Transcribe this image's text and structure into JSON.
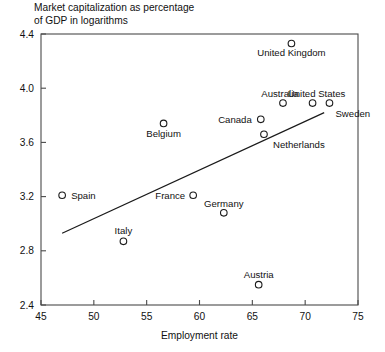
{
  "chart_data": {
    "type": "scatter",
    "title_line1": "Market capitalization as percentage",
    "title_line2": "of GDP in logarithms",
    "xlabel": "Employment rate",
    "ylabel": "",
    "xlim": [
      45,
      75
    ],
    "ylim": [
      2.4,
      4.4
    ],
    "xticks": [
      45,
      50,
      55,
      60,
      65,
      70,
      75
    ],
    "xtick_labels": [
      "45",
      "50",
      "55",
      "60",
      "65",
      "70",
      "75"
    ],
    "yticks": [
      2.4,
      2.8,
      3.2,
      3.6,
      4.0,
      4.4
    ],
    "ytick_labels": [
      "2.4",
      "2.8",
      "3.2",
      "3.6",
      "4.0",
      "4.4"
    ],
    "grid": false,
    "legend": false,
    "marker": "open-circle",
    "marker_color": "#1a1a1a",
    "points": [
      {
        "label": "United Kingdom",
        "x": 68.7,
        "y": 4.33,
        "label_dx": 0,
        "label_dy": 13,
        "label_anchor": "middle"
      },
      {
        "label": "Australia",
        "x": 67.9,
        "y": 3.89,
        "label_dx": -3,
        "label_dy": -6,
        "label_anchor": "middle"
      },
      {
        "label": "United States",
        "x": 70.7,
        "y": 3.89,
        "label_dx": 4,
        "label_dy": -6,
        "label_anchor": "middle"
      },
      {
        "label": "Sweden",
        "x": 72.3,
        "y": 3.89,
        "label_dx": 6,
        "label_dy": 14,
        "label_anchor": "start"
      },
      {
        "label": "Canada",
        "x": 65.8,
        "y": 3.77,
        "label_dx": -9,
        "label_dy": 4,
        "label_anchor": "end"
      },
      {
        "label": "Netherlands",
        "x": 66.1,
        "y": 3.66,
        "label_dx": 9,
        "label_dy": 14,
        "label_anchor": "start"
      },
      {
        "label": "Belgium",
        "x": 56.6,
        "y": 3.74,
        "label_dx": 0,
        "label_dy": 14,
        "label_anchor": "middle"
      },
      {
        "label": "Spain",
        "x": 47.0,
        "y": 3.21,
        "label_dx": 9,
        "label_dy": 4,
        "label_anchor": "start"
      },
      {
        "label": "France",
        "x": 59.4,
        "y": 3.21,
        "label_dx": -8,
        "label_dy": 4,
        "label_anchor": "end"
      },
      {
        "label": "Germany",
        "x": 62.3,
        "y": 3.08,
        "label_dx": 0,
        "label_dy": -6,
        "label_anchor": "middle"
      },
      {
        "label": "Italy",
        "x": 52.8,
        "y": 2.87,
        "label_dx": 0,
        "label_dy": -7,
        "label_anchor": "middle"
      },
      {
        "label": "Austria",
        "x": 65.6,
        "y": 2.55,
        "label_dx": 0,
        "label_dy": -7,
        "label_anchor": "middle"
      }
    ],
    "trend_line": {
      "x_start": 47.0,
      "y_start": 2.93,
      "x_end": 71.8,
      "y_end": 3.82
    }
  }
}
